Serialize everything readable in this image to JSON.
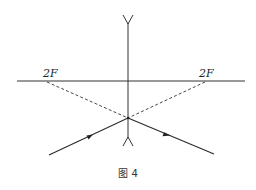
{
  "diagram": {
    "type": "optics-concave-lens-ray-diagram",
    "lens": {
      "kind": "concave (diverging) lens"
    },
    "principal_axis": {
      "label": ""
    },
    "focal_points": [
      {
        "label": "2F",
        "side": "left"
      },
      {
        "label": "2F",
        "side": "right"
      }
    ],
    "rays": [
      {
        "name": "incident-ray",
        "direction": "toward lens from lower-left"
      },
      {
        "name": "refracted-ray",
        "direction": "away from lens toward lower-right"
      }
    ],
    "construction_lines": [
      {
        "name": "dashed-line-left",
        "from": "left 2F",
        "to": "ray point on lens"
      },
      {
        "name": "dashed-line-right",
        "from": "right 2F",
        "to": "ray point on lens"
      }
    ],
    "caption": "图 4"
  },
  "colors": {
    "ink": "#333333",
    "background": "#ffffff"
  }
}
